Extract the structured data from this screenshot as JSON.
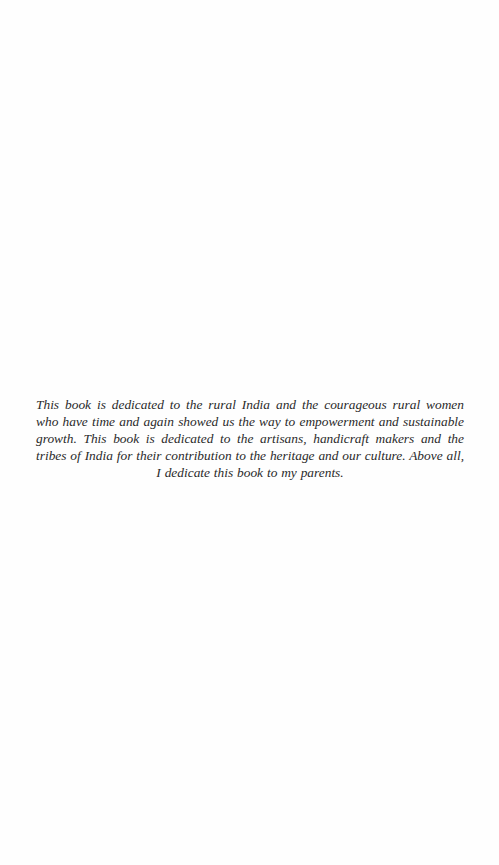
{
  "page": {
    "type": "dedication",
    "dedication_text": "This book is dedicated to the rural India and the courageous rural women who have time and again showed us the way to empowerment and sustainable growth. This book is dedicated to the artisans, handicraft makers and the tribes of India for their contribution to the heritage and our culture. Above all, I dedicate this book to my parents.",
    "colors": {
      "background": "#fefefe",
      "text": "#2a2a2a"
    }
  }
}
